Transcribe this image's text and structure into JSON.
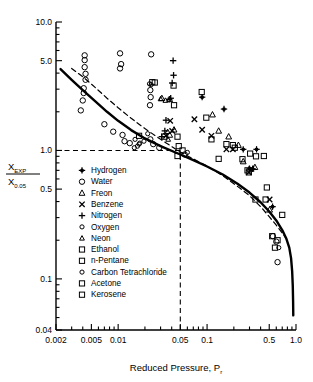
{
  "chart_data": {
    "type": "scatter",
    "title": "",
    "xlabel": "Reduced Pressure, P",
    "xlabel_sub": "r",
    "ylabel_num": "X",
    "ylabel_num_sub": "EXP",
    "ylabel_den": "X",
    "ylabel_den_sub": "0.05",
    "xscale": "log",
    "yscale": "log",
    "xlim": [
      0.002,
      1.0
    ],
    "ylim": [
      0.04,
      10.0
    ],
    "grid": false,
    "legend_position": "inner-lower-left",
    "xticks": [
      0.002,
      0.005,
      0.01,
      0.05,
      0.1,
      0.5,
      1.0
    ],
    "xticklabels": [
      "0.002",
      "0.005",
      "0.01",
      "0.05",
      "0.1",
      "0.5",
      "1.0"
    ],
    "yticks": [
      0.04,
      0.1,
      0.5,
      1.0,
      5.0,
      10.0
    ],
    "yticklabels": [
      "0.04",
      "0.1",
      "0.5",
      "1.0",
      "5.0",
      "10.0"
    ],
    "reference_lines": [
      {
        "name": "horizontal-unity-line",
        "style": "dashed",
        "y": 1.0,
        "x_from": 0.002,
        "x_to": 0.05
      },
      {
        "name": "vertical-pr005-line",
        "style": "dashed",
        "x": 0.05,
        "y_from": 0.04,
        "y_to": 1.0
      }
    ],
    "curves": [
      {
        "name": "solid-correlation-curve",
        "style": "solid",
        "points": [
          [
            0.00225,
            4.3
          ],
          [
            0.003,
            3.55
          ],
          [
            0.004,
            2.95
          ],
          [
            0.0055,
            2.42
          ],
          [
            0.0075,
            2.0
          ],
          [
            0.01,
            1.7
          ],
          [
            0.014,
            1.44
          ],
          [
            0.02,
            1.24
          ],
          [
            0.03,
            1.08
          ],
          [
            0.05,
            0.93
          ],
          [
            0.07,
            0.84
          ],
          [
            0.1,
            0.75
          ],
          [
            0.15,
            0.65
          ],
          [
            0.22,
            0.55
          ],
          [
            0.3,
            0.47
          ],
          [
            0.4,
            0.395
          ],
          [
            0.5,
            0.335
          ],
          [
            0.6,
            0.285
          ],
          [
            0.7,
            0.24
          ],
          [
            0.78,
            0.205
          ],
          [
            0.84,
            0.175
          ],
          [
            0.88,
            0.145
          ],
          [
            0.905,
            0.115
          ],
          [
            0.92,
            0.088
          ],
          [
            0.928,
            0.066
          ],
          [
            0.932,
            0.052
          ]
        ]
      },
      {
        "name": "dashed-correlation-curve",
        "style": "dashed",
        "points": [
          [
            0.003,
            4.35
          ],
          [
            0.004,
            3.75
          ],
          [
            0.0055,
            3.1
          ],
          [
            0.0075,
            2.55
          ],
          [
            0.01,
            2.15
          ],
          [
            0.014,
            1.78
          ],
          [
            0.02,
            1.48
          ],
          [
            0.03,
            1.22
          ],
          [
            0.05,
            0.97
          ],
          [
            0.07,
            0.86
          ],
          [
            0.1,
            0.755
          ],
          [
            0.15,
            0.635
          ],
          [
            0.22,
            0.525
          ],
          [
            0.3,
            0.445
          ],
          [
            0.4,
            0.365
          ],
          [
            0.5,
            0.305
          ],
          [
            0.6,
            0.262
          ],
          [
            0.7,
            0.228
          ],
          [
            0.78,
            0.205
          ]
        ]
      }
    ],
    "series": [
      {
        "name": "Hydrogen",
        "marker": "filled-star",
        "points": [
          [
            0.088,
            2.6
          ],
          [
            0.155,
            2.1
          ],
          [
            0.255,
            1.02
          ],
          [
            0.325,
            0.72
          ],
          [
            0.36,
            1.02
          ],
          [
            0.545,
            0.365
          ],
          [
            0.3,
            0.72
          ]
        ]
      },
      {
        "name": "Water",
        "marker": "open-circle",
        "points": [
          [
            0.0042,
            5.5
          ],
          [
            0.0042,
            5.05
          ],
          [
            0.0042,
            4.45
          ],
          [
            0.0043,
            3.95
          ],
          [
            0.0043,
            3.55
          ],
          [
            0.0041,
            3.05
          ],
          [
            0.0041,
            2.8
          ],
          [
            0.004,
            2.45
          ],
          [
            0.0038,
            2.05
          ],
          [
            0.0105,
            5.7
          ],
          [
            0.0108,
            4.7
          ],
          [
            0.0105,
            4.35
          ],
          [
            0.0235,
            5.6
          ],
          [
            0.023,
            2.95
          ],
          [
            0.0232,
            2.6
          ],
          [
            0.0228,
            2.25
          ],
          [
            0.007,
            1.6
          ],
          [
            0.0088,
            1.4
          ],
          [
            0.0112,
            1.32
          ],
          [
            0.0118,
            1.18
          ],
          [
            0.0135,
            1.14
          ],
          [
            0.023,
            1.22
          ],
          [
            0.0248,
            1.12
          ],
          [
            0.029,
            1.05
          ],
          [
            0.056,
            0.93
          ],
          [
            0.6,
            0.195
          ],
          [
            0.62,
            0.135
          ],
          [
            0.55,
            0.215
          ]
        ]
      },
      {
        "name": "Freon",
        "marker": "open-triangle",
        "points": [
          [
            0.031,
            2.55
          ],
          [
            0.038,
            2.5
          ],
          [
            0.0425,
            1.45
          ],
          [
            0.115,
            1.9
          ],
          [
            0.135,
            1.42
          ],
          [
            0.175,
            1.28
          ],
          [
            0.225,
            1.1
          ],
          [
            0.345,
            0.74
          ],
          [
            0.255,
            0.82
          ],
          [
            0.038,
            1.32
          ],
          [
            0.505,
            0.345
          ]
        ]
      },
      {
        "name": "Benzene",
        "marker": "x-cross",
        "points": [
          [
            0.0385,
            1.7
          ],
          [
            0.072,
            1.75
          ],
          [
            0.088,
            1.45
          ],
          [
            0.112,
            1.3
          ],
          [
            0.165,
            1.02
          ],
          [
            0.195,
            1.02
          ],
          [
            0.315,
            0.72
          ],
          [
            0.295,
            0.675
          ],
          [
            0.505,
            0.415
          ],
          [
            0.0405,
            1.42
          ],
          [
            0.0345,
            1.3
          ]
        ]
      },
      {
        "name": "Nitrogen",
        "marker": "plus",
        "points": [
          [
            0.0415,
            5.0
          ],
          [
            0.042,
            3.85
          ],
          [
            0.0405,
            3.35
          ],
          [
            0.039,
            2.55
          ],
          [
            0.0375,
            2.5
          ],
          [
            0.0345,
            1.72
          ],
          [
            0.0335,
            1.42
          ],
          [
            0.031,
            1.28
          ]
        ]
      },
      {
        "name": "Oxygen",
        "marker": "small-circle",
        "points": [
          [
            0.0225,
            3.3
          ],
          [
            0.0235,
            3.25
          ],
          [
            0.0215,
            1.35
          ],
          [
            0.0195,
            1.18
          ],
          [
            0.0172,
            1.12
          ],
          [
            0.0165,
            1.08
          ]
        ]
      },
      {
        "name": "Neon",
        "marker": "small-triangle",
        "points": [
          [
            0.03,
            2.52
          ],
          [
            0.034,
            2.45
          ],
          [
            0.036,
            1.4
          ],
          [
            0.0365,
            1.22
          ]
        ]
      },
      {
        "name": "Ethanol",
        "marker": "open-square",
        "points": [
          [
            0.0242,
            3.4
          ],
          [
            0.0258,
            3.38
          ],
          [
            0.042,
            3.2
          ],
          [
            0.0425,
            2.25
          ],
          [
            0.0465,
            1.28
          ],
          [
            0.048,
            1.08
          ],
          [
            0.053,
            1.0
          ],
          [
            0.0465,
            0.905
          ],
          [
            0.087,
            2.85
          ],
          [
            0.098,
            1.8
          ],
          [
            0.112,
            1.22
          ],
          [
            0.135,
            0.86
          ]
        ]
      },
      {
        "name": "n-Pentane",
        "marker": "open-square",
        "points": [
          [
            0.0172,
            1.3
          ],
          [
            0.033,
            1.28
          ],
          [
            0.165,
            1.12
          ],
          [
            0.205,
            1.05
          ],
          [
            0.285,
            0.7
          ],
          [
            0.305,
            0.945
          ],
          [
            0.355,
            0.9
          ]
        ]
      },
      {
        "name": "Carbon Tetrachloride",
        "marker": "small-circle",
        "points": [
          [
            0.0155,
            1.22
          ],
          [
            0.0175,
            1.14
          ],
          [
            0.0152,
            1.05
          ],
          [
            0.06,
            0.965
          ],
          [
            0.64,
            0.175
          ]
        ]
      },
      {
        "name": "Acetone",
        "marker": "open-square",
        "points": [
          [
            0.195,
            1.1
          ],
          [
            0.25,
            0.855
          ],
          [
            0.295,
            0.675
          ],
          [
            0.435,
            0.905
          ],
          [
            0.47,
            0.515
          ],
          [
            0.58,
            0.175
          ],
          [
            0.7,
            0.315
          ]
        ]
      },
      {
        "name": "Kerosene",
        "marker": "open-square",
        "points": [
          [
            0.35,
            0.415
          ],
          [
            0.455,
            0.415
          ],
          [
            0.54,
            0.215
          ],
          [
            0.62,
            0.2
          ]
        ]
      }
    ]
  },
  "legend": {
    "entries": [
      {
        "label": "Hydrogen",
        "marker": "filled-star"
      },
      {
        "label": "Water",
        "marker": "open-circle"
      },
      {
        "label": "Freon",
        "marker": "open-triangle"
      },
      {
        "label": "Benzene",
        "marker": "x-cross"
      },
      {
        "label": "Nitrogen",
        "marker": "plus"
      },
      {
        "label": "Oxygen",
        "marker": "small-circle"
      },
      {
        "label": "Neon",
        "marker": "small-triangle"
      },
      {
        "label": "Ethanol",
        "marker": "open-square"
      },
      {
        "label": "n-Pentane",
        "marker": "open-square"
      },
      {
        "label": "Carbon Tetrachloride",
        "marker": "small-circle"
      },
      {
        "label": "Acetone",
        "marker": "open-square"
      },
      {
        "label": "Kerosene",
        "marker": "open-square"
      }
    ]
  },
  "colors": {
    "ink": "#000000",
    "background": "#ffffff"
  }
}
